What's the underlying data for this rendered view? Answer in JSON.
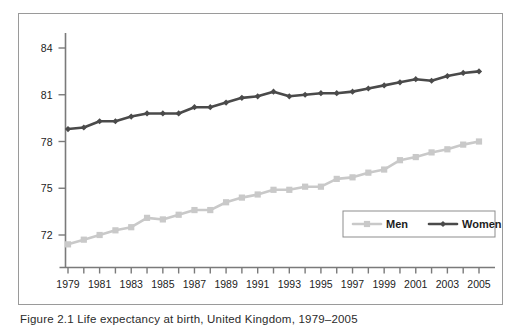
{
  "figure": {
    "caption": "Figure 2.1  Life expectancy at birth, United Kingdom, 1979–2005",
    "frame_color": "#9a9a9a",
    "background": "#ffffff"
  },
  "chart_data": {
    "type": "line",
    "title": "",
    "subtitle": "",
    "xlabel": "",
    "ylabel": "",
    "x": [
      1979,
      1980,
      1981,
      1982,
      1983,
      1984,
      1985,
      1986,
      1987,
      1988,
      1989,
      1990,
      1991,
      1992,
      1993,
      1994,
      1995,
      1996,
      1997,
      1998,
      1999,
      2000,
      2001,
      2002,
      2003,
      2004,
      2005
    ],
    "xtick_labels": [
      "1979",
      "",
      "1981",
      "",
      "1983",
      "",
      "1985",
      "",
      "1987",
      "",
      "1989",
      "",
      "1991",
      "",
      "1993",
      "",
      "1995",
      "",
      "1997",
      "",
      "1999",
      "",
      "2001",
      "",
      "2003",
      "",
      "2005"
    ],
    "xtick_labels_shown": [
      "1979",
      "1981",
      "1983",
      "1985",
      "1987",
      "1989",
      "1991",
      "1993",
      "1995",
      "1997",
      "1999",
      "2001",
      "2003",
      "2005"
    ],
    "ytick_labels": [
      "72",
      "75",
      "78",
      "81",
      "84"
    ],
    "yticks": [
      72,
      75,
      78,
      81,
      84
    ],
    "ylim": [
      70.2,
      85.0
    ],
    "xlim": [
      1978.4,
      2005.8
    ],
    "grid": false,
    "legend_position": "bottom-right",
    "series": [
      {
        "name": "Men",
        "color": "#c9c9c9",
        "marker": "square",
        "values": [
          71.4,
          71.7,
          72.0,
          72.3,
          72.5,
          73.1,
          73.0,
          73.3,
          73.6,
          73.6,
          74.1,
          74.4,
          74.6,
          74.9,
          74.9,
          75.1,
          75.1,
          75.6,
          75.7,
          76.0,
          76.2,
          76.8,
          77.0,
          77.3,
          77.5,
          77.8,
          78.0
        ]
      },
      {
        "name": "Women",
        "color": "#4a4a4a",
        "marker": "diamond",
        "values": [
          78.8,
          78.9,
          79.3,
          79.3,
          79.6,
          79.8,
          79.8,
          79.8,
          80.2,
          80.2,
          80.5,
          80.8,
          80.9,
          81.2,
          80.9,
          81.0,
          81.1,
          81.1,
          81.2,
          81.4,
          81.6,
          81.8,
          82.0,
          81.9,
          82.2,
          82.4,
          82.5
        ]
      }
    ]
  },
  "legend": {
    "items": [
      {
        "label": "Men",
        "color": "#c9c9c9",
        "marker": "square"
      },
      {
        "label": "Women",
        "color": "#4a4a4a",
        "marker": "diamond"
      }
    ]
  },
  "axes": {
    "axis_color": "#7a7a7a",
    "tick_color": "#7a7a7a",
    "text_color": "#1d1d1d"
  }
}
